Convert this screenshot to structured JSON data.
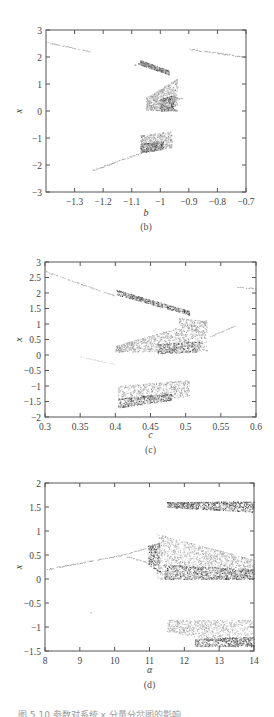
{
  "figure": {
    "caption_partial": "图 5.10 参数对系统 x 分量分岔图的影响"
  },
  "chart_data": [
    {
      "type": "scatter",
      "id": "b",
      "sub_caption": "(b)",
      "title": "",
      "xlabel": "b",
      "ylabel": "x",
      "xlim": [
        -1.4,
        -0.7
      ],
      "ylim": [
        -3,
        3
      ],
      "x_ticks": [
        -1.3,
        -1.2,
        -1.1,
        -1,
        -0.9,
        -0.8,
        -0.7
      ],
      "x_tick_labels": [
        "-1.3",
        "-1.2",
        "-1.1",
        "-1",
        "-0.9",
        "-0.8",
        "-0.7"
      ],
      "y_ticks": [
        -3,
        -2,
        -1,
        0,
        1,
        2,
        3
      ],
      "y_tick_labels": [
        "-3",
        "-2",
        "-1",
        "0",
        "1",
        "2",
        "3"
      ],
      "grid": false,
      "plot_box": {
        "left": 46,
        "top": 30,
        "right": 246,
        "bottom": 192
      },
      "description": "Bifurcation diagram of x versus parameter b: period-1 branches at edges, chaotic bands between b≈-1.07 and b≈-0.94",
      "lines": [
        {
          "x": [
            -1.4,
            -1.24
          ],
          "y": [
            2.55,
            2.2
          ],
          "shade": 0.75
        },
        {
          "x": [
            -1.24,
            -1.07
          ],
          "y": [
            -2.2,
            -1.55
          ],
          "shade": 0.7
        },
        {
          "x": [
            -0.9,
            -0.7
          ],
          "y": [
            2.3,
            2.0
          ],
          "shade": 0.7
        },
        {
          "x": [
            -1.09,
            -1.06
          ],
          "y": [
            1.72,
            1.8
          ],
          "shade": 0.6
        },
        {
          "x": [
            -0.96,
            -0.92
          ],
          "y": [
            0.4,
            0.5
          ],
          "shade": 0.75
        }
      ],
      "bands": [
        {
          "x0": -1.07,
          "x1": -0.97,
          "ytop0": 1.88,
          "ytop1": 1.5,
          "ybot0": 1.72,
          "ybot1": 1.35,
          "n": 420,
          "density": 0.8
        },
        {
          "x0": -1.05,
          "x1": -0.94,
          "ytop0": 0.5,
          "ytop1": 1.2,
          "ybot0": 0.05,
          "ybot1": 0.0,
          "n": 700,
          "density": 0.45
        },
        {
          "x0": -1.0,
          "x1": -0.95,
          "ytop0": 0.45,
          "ytop1": 0.6,
          "ybot0": 0.0,
          "ybot1": 0.05,
          "n": 260,
          "density": 0.85
        },
        {
          "x0": -1.07,
          "x1": -0.96,
          "ytop0": -0.9,
          "ytop1": -0.75,
          "ybot0": -1.55,
          "ybot1": -1.35,
          "n": 480,
          "density": 0.5
        },
        {
          "x0": -1.07,
          "x1": -0.99,
          "ytop0": -1.2,
          "ytop1": -1.15,
          "ybot0": -1.55,
          "ybot1": -1.4,
          "n": 300,
          "density": 0.85
        }
      ]
    },
    {
      "type": "scatter",
      "id": "c",
      "sub_caption": "(c)",
      "title": "",
      "xlabel": "c",
      "ylabel": "x",
      "xlim": [
        0.3,
        0.6
      ],
      "ylim": [
        -2,
        3
      ],
      "x_ticks": [
        0.3,
        0.35,
        0.4,
        0.45,
        0.5,
        0.55,
        0.6
      ],
      "x_tick_labels": [
        "0.3",
        "0.35",
        "0.4",
        "0.45",
        "0.5",
        "0.55",
        "0.6"
      ],
      "y_ticks": [
        -2,
        -1.5,
        -1,
        -0.5,
        0,
        0.5,
        1,
        1.5,
        2,
        2.5,
        3
      ],
      "y_tick_labels": [
        "-2",
        "-1.5",
        "-1",
        "-0.5",
        "0",
        "0.5",
        "1",
        "1.5",
        "2",
        "2.5",
        "3"
      ],
      "grid": false,
      "plot_box": {
        "left": 45,
        "top": 262,
        "right": 256,
        "bottom": 417
      },
      "description": "Bifurcation diagram of x versus parameter c: period-1 branch for c<0.4 and c>0.57, chaotic attractor for 0.4<c<0.53",
      "lines": [
        {
          "x": [
            0.3,
            0.4
          ],
          "y": [
            2.7,
            1.9
          ],
          "shade": 0.75
        },
        {
          "x": [
            0.57,
            0.6
          ],
          "y": [
            2.2,
            2.15
          ],
          "shade": 0.7
        },
        {
          "x": [
            0.53,
            0.57
          ],
          "y": [
            0.55,
            0.95
          ],
          "shade": 0.75
        },
        {
          "x": [
            0.35,
            0.4
          ],
          "y": [
            -0.05,
            -0.3
          ],
          "shade": 0.9
        }
      ],
      "bands": [
        {
          "x0": 0.402,
          "x1": 0.505,
          "ytop0": 2.1,
          "ytop1": 1.42,
          "ybot0": 1.95,
          "ybot1": 1.3,
          "n": 520,
          "density": 0.85
        },
        {
          "x0": 0.49,
          "x1": 0.53,
          "ytop0": 1.2,
          "ytop1": 1.1,
          "ybot0": 1.0,
          "ybot1": 0.6,
          "n": 140,
          "density": 0.5
        },
        {
          "x0": 0.4,
          "x1": 0.53,
          "ytop0": 0.3,
          "ytop1": 1.15,
          "ybot0": 0.1,
          "ybot1": 0.15,
          "n": 900,
          "density": 0.45
        },
        {
          "x0": 0.46,
          "x1": 0.52,
          "ytop0": 0.35,
          "ytop1": 0.45,
          "ybot0": 0.05,
          "ybot1": 0.1,
          "n": 300,
          "density": 0.85
        },
        {
          "x0": 0.403,
          "x1": 0.505,
          "ytop0": -1.0,
          "ytop1": -0.8,
          "ybot0": -1.7,
          "ybot1": -1.3,
          "n": 650,
          "density": 0.45
        },
        {
          "x0": 0.403,
          "x1": 0.48,
          "ytop0": -1.4,
          "ytop1": -1.25,
          "ybot0": -1.7,
          "ybot1": -1.45,
          "n": 360,
          "density": 0.85
        }
      ]
    },
    {
      "type": "scatter",
      "id": "d",
      "sub_caption": "(d)",
      "title": "",
      "xlabel": "α",
      "ylabel": "x",
      "xlim": [
        8,
        14
      ],
      "ylim": [
        -1.5,
        2
      ],
      "x_ticks": [
        8,
        9,
        10,
        11,
        12,
        13,
        14
      ],
      "x_tick_labels": [
        "8",
        "9",
        "10",
        "11",
        "12",
        "13",
        "14"
      ],
      "y_ticks": [
        -1.5,
        -1,
        -0.5,
        0,
        0.5,
        1,
        1.5,
        2
      ],
      "y_tick_labels": [
        "-1.5",
        "-1",
        "-0.5",
        "0",
        "0.5",
        "1",
        "1.5",
        "2"
      ],
      "grid": false,
      "plot_box": {
        "left": 45,
        "top": 483,
        "right": 254,
        "bottom": 651
      },
      "description": "Bifurcation diagram of x versus parameter α: period-1 branch rising for α<10.5, period-2 split near 10.5, chaos beyond α≈11",
      "lines": [
        {
          "x": [
            8,
            10.2
          ],
          "y": [
            0.2,
            0.5
          ],
          "shade": 0.7
        },
        {
          "x": [
            10.2,
            10.9
          ],
          "y": [
            0.5,
            0.65
          ],
          "shade": 0.75
        },
        {
          "x": [
            10.3,
            10.95
          ],
          "y": [
            0.48,
            0.35
          ],
          "shade": 0.75
        },
        {
          "x": [
            9.3,
            9.32
          ],
          "y": [
            -0.68,
            -0.7
          ],
          "shade": 0.85
        }
      ],
      "bands": [
        {
          "x0": 11.5,
          "x1": 14.0,
          "ytop0": 1.6,
          "ytop1": 1.62,
          "ybot0": 1.5,
          "ybot1": 1.4,
          "n": 800,
          "density": 0.9
        },
        {
          "x0": 10.95,
          "x1": 11.3,
          "ytop0": 0.7,
          "ytop1": 0.75,
          "ybot0": 0.3,
          "ybot1": 0.15,
          "n": 260,
          "density": 0.9
        },
        {
          "x0": 11.2,
          "x1": 14.0,
          "ytop0": 0.95,
          "ytop1": 0.4,
          "ybot0": 0.0,
          "ybot1": 0.0,
          "n": 1500,
          "density": 0.4
        },
        {
          "x0": 11.4,
          "x1": 14.0,
          "ytop0": 0.3,
          "ytop1": 0.2,
          "ybot0": 0.0,
          "ybot1": 0.0,
          "n": 700,
          "density": 0.85
        },
        {
          "x0": 11.5,
          "x1": 14.0,
          "ytop0": -0.85,
          "ytop1": -0.85,
          "ybot0": -1.1,
          "ybot1": -1.4,
          "n": 800,
          "density": 0.35
        },
        {
          "x0": 12.3,
          "x1": 14.0,
          "ytop0": -1.25,
          "ytop1": -1.2,
          "ybot0": -1.4,
          "ybot1": -1.4,
          "n": 500,
          "density": 0.85
        }
      ]
    }
  ]
}
